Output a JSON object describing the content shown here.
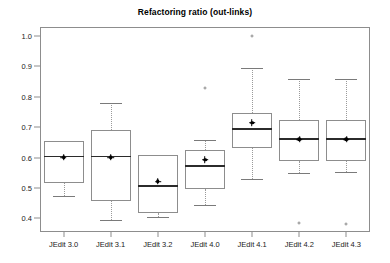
{
  "chart_data": {
    "type": "box",
    "title": "Refactoring ratio (out-links)",
    "xlabel": "",
    "ylabel": "",
    "ylim": [
      0.355,
      1.03
    ],
    "grid": false,
    "legend": null,
    "yticks": [
      0.4,
      0.5,
      0.6,
      0.7,
      0.8,
      0.9,
      1.0
    ],
    "ytick_labels": [
      "0.4",
      "0.5",
      "0.6",
      "0.7",
      "0.8",
      "0.9",
      "1.0"
    ],
    "categories": [
      "JEdit 3.0",
      "JEdit 3.1",
      "JEdit 3.2",
      "JEdit 4.0",
      "JEdit 4.1",
      "JEdit 4.2",
      "JEdit 4.3"
    ],
    "boxes": [
      {
        "category": "JEdit 3.0",
        "whisker_low": 0.475,
        "q1": 0.515,
        "median": 0.604,
        "q3": 0.655,
        "whisker_high": 0.655,
        "mean": 0.601,
        "outliers": []
      },
      {
        "category": "JEdit 3.1",
        "whisker_low": 0.393,
        "q1": 0.456,
        "median": 0.604,
        "q3": 0.69,
        "whisker_high": 0.78,
        "mean": 0.601,
        "outliers": []
      },
      {
        "category": "JEdit 3.2",
        "whisker_low": 0.403,
        "q1": 0.417,
        "median": 0.506,
        "q3": 0.608,
        "whisker_high": 0.608,
        "mean": 0.522,
        "outliers": []
      },
      {
        "category": "JEdit 4.0",
        "whisker_low": 0.443,
        "q1": 0.498,
        "median": 0.573,
        "q3": 0.625,
        "whisker_high": 0.657,
        "mean": 0.593,
        "outliers": [
          0.829
        ]
      },
      {
        "category": "JEdit 4.1",
        "whisker_low": 0.531,
        "q1": 0.631,
        "median": 0.695,
        "q3": 0.747,
        "whisker_high": 0.894,
        "mean": 0.715,
        "outliers": [
          1.0
        ]
      },
      {
        "category": "JEdit 4.2",
        "whisker_low": 0.55,
        "q1": 0.588,
        "median": 0.662,
        "q3": 0.723,
        "whisker_high": 0.86,
        "mean": 0.66,
        "outliers": [
          0.384
        ]
      },
      {
        "category": "JEdit 4.3",
        "whisker_low": 0.553,
        "q1": 0.588,
        "median": 0.662,
        "q3": 0.723,
        "whisker_high": 0.86,
        "mean": 0.66,
        "outliers": [
          0.38
        ]
      }
    ],
    "colors": {
      "box_edge": "#8d8d8d",
      "median": "#2b2b2b",
      "whisker": "#9a9a9a",
      "mean": "#000000",
      "frame": "#8d8d8d",
      "background": "#ffffff",
      "text": "#1a1a1a"
    }
  }
}
